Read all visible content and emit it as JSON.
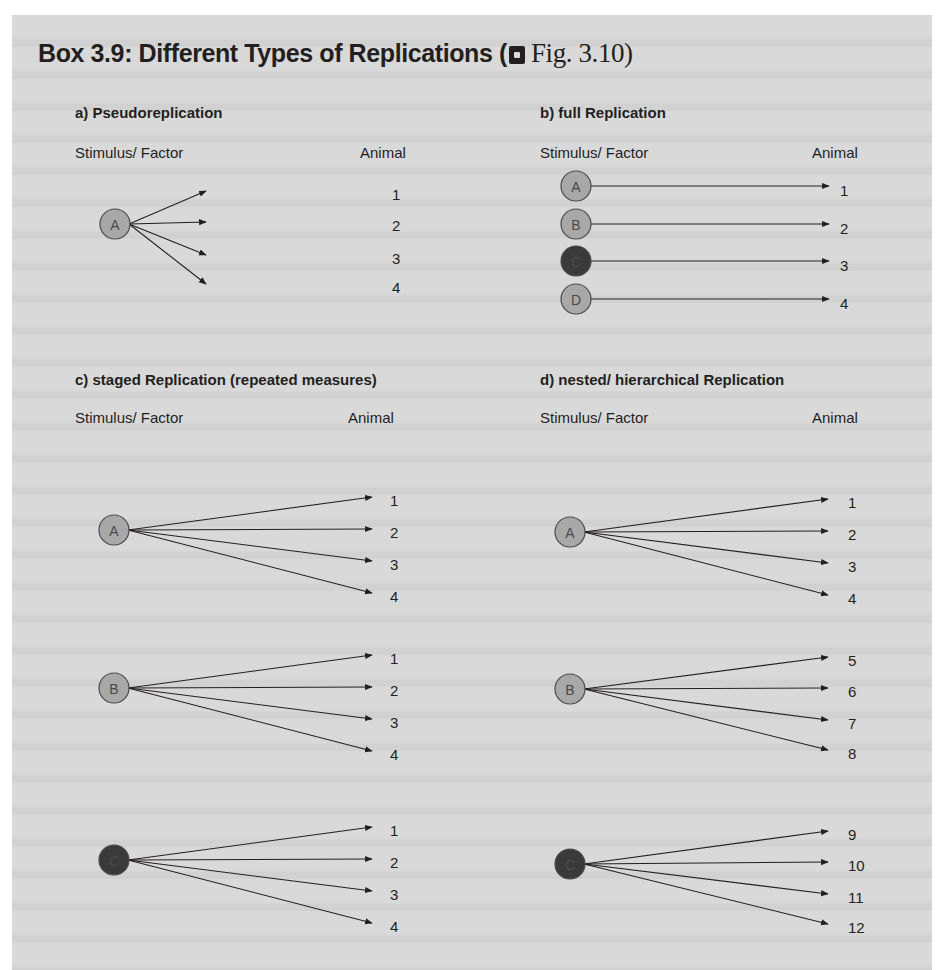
{
  "title": {
    "text": "Box 3.9: Different Types of Replications (",
    "fig_ref": "Fig. 3.10)",
    "fig_icon": "figure-reference-icon"
  },
  "colors": {
    "background": "#d9d9d9",
    "node_light": "#a8a8a8",
    "node_dark": "#3a3a3a",
    "line": "#231f20",
    "text": "#231f20"
  },
  "panels": {
    "a": {
      "title": "a)  Pseudoreplication",
      "left_label": "Stimulus/ Factor",
      "right_label": "Animal",
      "groups": [
        {
          "stimulus": "A",
          "shade": "light",
          "animals": [
            "1",
            "2",
            "3",
            "4"
          ]
        }
      ]
    },
    "b": {
      "title": "b) full Replication",
      "left_label": "Stimulus/ Factor",
      "right_label": "Animal",
      "groups": [
        {
          "stimulus": "A",
          "shade": "light",
          "animals": [
            "1"
          ]
        },
        {
          "stimulus": "B",
          "shade": "light",
          "animals": [
            "2"
          ]
        },
        {
          "stimulus": "C",
          "shade": "dark",
          "animals": [
            "3"
          ]
        },
        {
          "stimulus": "D",
          "shade": "light",
          "animals": [
            "4"
          ]
        }
      ]
    },
    "c": {
      "title": "c) staged Replication (repeated measures)",
      "left_label": "Stimulus/ Factor",
      "right_label": "Animal",
      "groups": [
        {
          "stimulus": "A",
          "shade": "light",
          "animals": [
            "1",
            "2",
            "3",
            "4"
          ]
        },
        {
          "stimulus": "B",
          "shade": "light",
          "animals": [
            "1",
            "2",
            "3",
            "4"
          ]
        },
        {
          "stimulus": "C",
          "shade": "dark",
          "animals": [
            "1",
            "2",
            "3",
            "4"
          ]
        }
      ]
    },
    "d": {
      "title": "d) nested/ hierarchical Replication",
      "left_label": "Stimulus/ Factor",
      "right_label": "Animal",
      "groups": [
        {
          "stimulus": "A",
          "shade": "light",
          "animals": [
            "1",
            "2",
            "3",
            "4"
          ]
        },
        {
          "stimulus": "B",
          "shade": "light",
          "animals": [
            "5",
            "6",
            "7",
            "8"
          ]
        },
        {
          "stimulus": "C",
          "shade": "dark",
          "animals": [
            "9",
            "10",
            "11",
            "12"
          ]
        }
      ]
    }
  }
}
